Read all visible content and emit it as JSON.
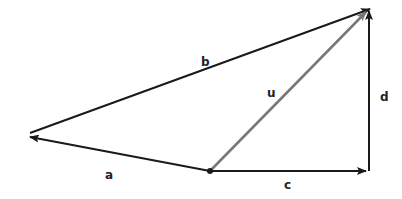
{
  "diagram": {
    "type": "vector-diagram",
    "colors": {
      "black_vector": "#1a1a1a",
      "resultant_vector": "#777777",
      "background": "#ffffff"
    },
    "origin": {
      "x": 210,
      "y": 171
    },
    "vectors": [
      {
        "name": "a",
        "label": "a",
        "from": [
          210,
          171
        ],
        "to": [
          30,
          137
        ],
        "color": "#1a1a1a",
        "label_pos": [
          105,
          179
        ]
      },
      {
        "name": "b",
        "label": "b",
        "from": [
          30,
          133
        ],
        "to": [
          370,
          9
        ],
        "color": "#1a1a1a",
        "label_pos": [
          201,
          66
        ]
      },
      {
        "name": "c",
        "label": "c",
        "from": [
          210,
          171
        ],
        "to": [
          366,
          171
        ],
        "color": "#1a1a1a",
        "label_pos": [
          284,
          189
        ]
      },
      {
        "name": "d",
        "label": "d",
        "from": [
          369,
          171
        ],
        "to": [
          369,
          11
        ],
        "color": "#1a1a1a",
        "label_pos": [
          380,
          101
        ]
      },
      {
        "name": "u",
        "label": "u",
        "from": [
          210,
          171
        ],
        "to": [
          366,
          12
        ],
        "color": "#777777",
        "label_pos": [
          267,
          97
        ]
      }
    ]
  }
}
